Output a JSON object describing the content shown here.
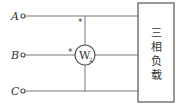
{
  "diagram": {
    "terminals": [
      {
        "label": "A"
      },
      {
        "label": "B"
      },
      {
        "label": "C"
      }
    ],
    "wattmeter": {
      "label": "W",
      "subscript": "2"
    },
    "polarity_mark": "*",
    "load": {
      "chars": [
        "三",
        "相",
        "负",
        "载"
      ]
    },
    "colors": {
      "line": "#666666",
      "text": "#333333"
    }
  }
}
